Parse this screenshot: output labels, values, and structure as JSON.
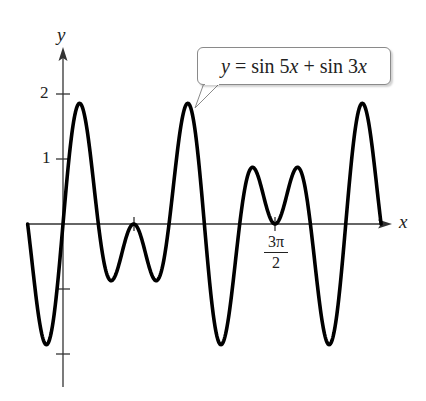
{
  "chart_data": {
    "type": "line",
    "title": "",
    "function": "y = sin 5x + sin 3x",
    "xlabel": "x",
    "ylabel": "y",
    "x_domain": [
      -0.7854,
      7.0686
    ],
    "x_domain_label": [
      "-π/4",
      "9π/4"
    ],
    "ylim": [
      -2.5,
      2.5
    ],
    "x_ticks": [
      {
        "value": 1.5708,
        "label": ""
      },
      {
        "value": 4.7124,
        "label": "3π/2"
      }
    ],
    "y_ticks": [
      {
        "value": 2,
        "label": "2"
      },
      {
        "value": 1,
        "label": "1"
      },
      {
        "value": -1,
        "label": ""
      },
      {
        "value": -2,
        "label": ""
      }
    ],
    "grid": false,
    "legend": null,
    "annotations": [
      {
        "text": "y = sin 5x + sin 3x",
        "type": "callout",
        "points_to": [
          2.95,
          1.87
        ]
      }
    ],
    "series": [
      {
        "name": "sin 5x + sin 3x",
        "expression": "Math.sin(5*x)+Math.sin(3*x)",
        "color": "#000000",
        "samples": 600
      }
    ]
  },
  "axes": {
    "x_label": "x",
    "y_label": "y",
    "y_tick_2": "2",
    "y_tick_1": "1",
    "x_tick_num": "3π",
    "x_tick_den": "2"
  },
  "callout": {
    "prefix": "y",
    "eq": " = sin 5",
    "x1": "x",
    "plus": " + sin 3",
    "x2": "x"
  },
  "colors": {
    "curve": "#000000",
    "axis": "#333333",
    "callout_border": "#8a8a8a"
  }
}
